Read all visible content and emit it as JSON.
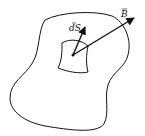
{
  "diagram": {
    "labels": {
      "ds": "dS",
      "b": "B"
    },
    "colors": {
      "stroke": "#111111",
      "background": "#ffffff"
    }
  }
}
